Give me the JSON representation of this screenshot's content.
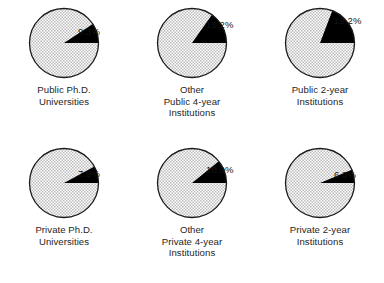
{
  "figure": {
    "type": "pie-chart-grid",
    "background_color": "#ffffff",
    "rows": 2,
    "columns": 3,
    "slice_fill_color": "#000000",
    "remainder_pattern": "light-gray-checkerboard",
    "outline_color": "#1a1a1a"
  },
  "chart_data": {
    "type": "pie",
    "title": "",
    "xlabel": "",
    "ylabel": "",
    "legend": [],
    "grid": false,
    "note": "Six separate pie charts; each highlights one percentage in solid black against a checker-patterned remainder.",
    "charts": [
      {
        "id": "public-phd-universities",
        "categories": [
          "Public Ph.D. Universities",
          "Remainder"
        ],
        "values": [
          9.3,
          90.7
        ],
        "highlight_label": "9.3%",
        "highlight_value": 9.3,
        "caption_lines": [
          "Public Ph.D.",
          "Universities"
        ]
      },
      {
        "id": "other-public-4-year",
        "categories": [
          "Other Public 4-year Institutions",
          "Remainder"
        ],
        "values": [
          15.2,
          84.8
        ],
        "highlight_label": "15.2%",
        "highlight_value": 15.2,
        "caption_lines": [
          "Other",
          "Public 4-year",
          "Institutions"
        ]
      },
      {
        "id": "public-2-year",
        "categories": [
          "Public 2-year Institutions",
          "Remainder"
        ],
        "values": [
          19.2,
          80.8
        ],
        "highlight_label": "19.2%",
        "highlight_value": 19.2,
        "caption_lines": [
          "Public 2-year",
          "Institutions"
        ]
      },
      {
        "id": "private-phd-universities",
        "categories": [
          "Private Ph.D. Universities",
          "Remainder"
        ],
        "values": [
          7.9,
          92.1
        ],
        "highlight_label": "7.9%",
        "highlight_value": 7.9,
        "caption_lines": [
          "Private Ph.D.",
          "Universities"
        ]
      },
      {
        "id": "other-private-4-year",
        "categories": [
          "Other Private 4-year Institutions",
          "Remainder"
        ],
        "values": [
          10.9,
          89.1
        ],
        "highlight_label": "10.9%",
        "highlight_value": 10.9,
        "caption_lines": [
          "Other",
          "Private 4-year",
          "Institutions"
        ]
      },
      {
        "id": "private-2-year",
        "categories": [
          "Private 2-year Institutions",
          "Remainder"
        ],
        "values": [
          6.3,
          93.7
        ],
        "highlight_label": "6.3%",
        "highlight_value": 6.3,
        "caption_lines": [
          "Private 2-year",
          "Institutions"
        ]
      }
    ]
  }
}
